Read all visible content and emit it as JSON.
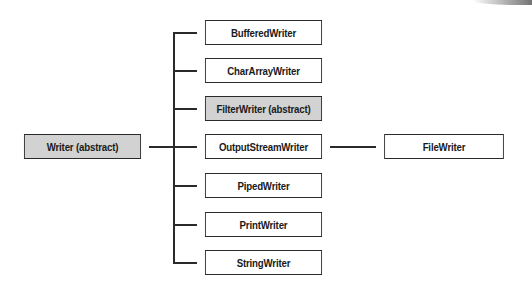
{
  "diagram": {
    "root": {
      "label": "Writer (abstract)",
      "abstract": true
    },
    "children": [
      {
        "label": "BufferedWriter",
        "abstract": false
      },
      {
        "label": "CharArrayWriter",
        "abstract": false
      },
      {
        "label": "FilterWriter (abstract)",
        "abstract": true
      },
      {
        "label": "OutputStreamWriter",
        "abstract": false
      },
      {
        "label": "PipedWriter",
        "abstract": false
      },
      {
        "label": "PrintWriter",
        "abstract": false
      },
      {
        "label": "StringWriter",
        "abstract": false
      }
    ],
    "grandchild": {
      "label": "FileWriter",
      "parent": "OutputStreamWriter",
      "abstract": false
    },
    "colors": {
      "abstract_fill": "#d2d2d2",
      "concrete_fill": "#ffffff",
      "stroke": "#2a2a2a"
    }
  }
}
